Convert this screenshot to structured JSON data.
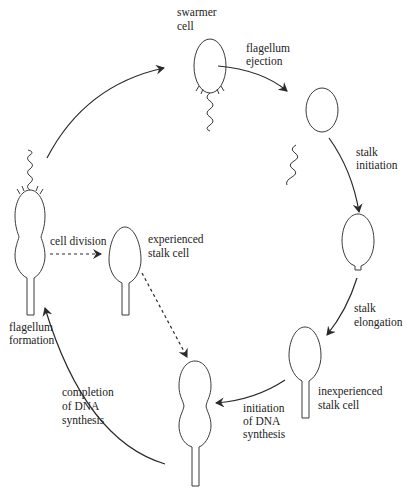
{
  "diagram": {
    "stages": {
      "swarmer": {
        "line1": "swarmer",
        "line2": "cell"
      },
      "experienced": {
        "line1": "experienced",
        "line2": "stalk cell"
      },
      "inexperienced": {
        "line1": "inexperienced",
        "line2": "stalk cell"
      }
    },
    "transitions": {
      "flagellum_ejection": {
        "line1": "flagellum",
        "line2": "ejection"
      },
      "stalk_initiation": {
        "line1": "stalk",
        "line2": "initiation"
      },
      "stalk_elongation": {
        "line1": "stalk",
        "line2": "elongation"
      },
      "dna_initiation": {
        "line1": "initiation",
        "line2": "of DNA",
        "line3": "synthesis"
      },
      "dna_completion": {
        "line1": "completion",
        "line2": "of DNA",
        "line3": "synthesis"
      },
      "flagellum_formation": {
        "line1": "flagellum",
        "line2": "formation"
      },
      "cell_division": {
        "line1": "cell division"
      }
    },
    "colors": {
      "stroke": "#2a2a2a",
      "text": "#222222",
      "background": "#ffffff"
    }
  }
}
